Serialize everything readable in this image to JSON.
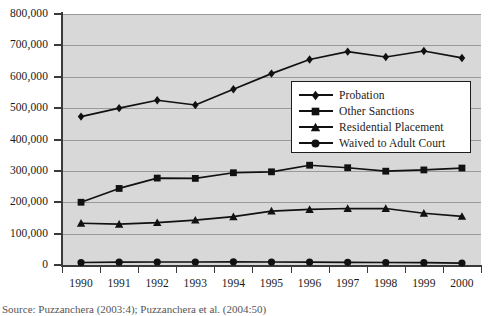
{
  "chart_data": {
    "type": "line",
    "title": "",
    "xlabel": "",
    "ylabel": "",
    "categories": [
      "1990",
      "1991",
      "1992",
      "1993",
      "1994",
      "1995",
      "1996",
      "1997",
      "1998",
      "1999",
      "2000"
    ],
    "ylim": [
      0,
      800000
    ],
    "ytick_labels": [
      "0",
      "100,000",
      "200,000",
      "300,000",
      "400,000",
      "500,000",
      "600,000",
      "700,000",
      "800,000"
    ],
    "ytick_values": [
      0,
      100000,
      200000,
      300000,
      400000,
      500000,
      600000,
      700000,
      800000
    ],
    "grid": true,
    "legend_position": "center-right-inside",
    "series": [
      {
        "name": "Probation",
        "marker": "diamond",
        "values": [
          473000,
          500000,
          525000,
          510000,
          560000,
          610000,
          655000,
          680000,
          663000,
          682000,
          660000
        ]
      },
      {
        "name": "Other Sanctions",
        "marker": "square",
        "values": [
          200000,
          244000,
          277000,
          276000,
          294000,
          297000,
          318000,
          310000,
          299000,
          303000,
          309000
        ]
      },
      {
        "name": "Residential Placement",
        "marker": "triangle",
        "values": [
          133000,
          130000,
          135000,
          143000,
          154000,
          172000,
          177000,
          180000,
          180000,
          165000,
          155000
        ]
      },
      {
        "name": "Waived to Adult Court",
        "marker": "circle",
        "values": [
          8000,
          9000,
          9500,
          9500,
          10000,
          9500,
          9000,
          8500,
          8000,
          7500,
          6000
        ]
      }
    ]
  },
  "caption": {
    "text": "Source: Puzzanchera (2003:4); Puzzanchera et al. (2004:50)"
  }
}
